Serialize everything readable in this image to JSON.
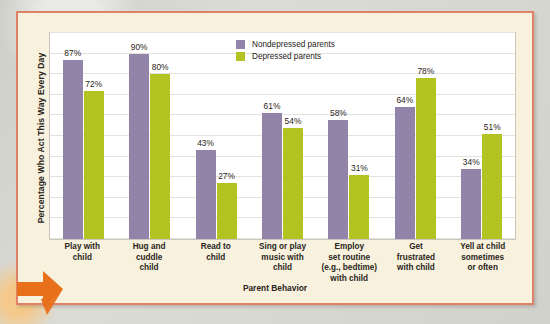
{
  "chart_data": {
    "type": "bar",
    "title": "",
    "xlabel": "Parent Behavior",
    "ylabel": "Percentage Who Act This Way Every Day",
    "ylim": [
      0,
      100
    ],
    "grid": true,
    "legend_position": "top-center",
    "value_suffix": "%",
    "categories": [
      "Play with\nchild",
      "Hug and\ncuddle\nchild",
      "Read to\nchild",
      "Sing or play\nmusic with\nchild",
      "Employ\nset routine\n(e.g., bedtime)\nwith child",
      "Get\nfrustrated\nwith child",
      "Yell at child\nsometimes\nor often"
    ],
    "series": [
      {
        "name": "Nondepressed parents",
        "color": "#9184a8",
        "values": [
          87,
          90,
          43,
          61,
          58,
          64,
          34
        ],
        "labels": [
          "87%",
          "90%",
          "43%",
          "61%",
          "58%",
          "64%",
          "34%"
        ]
      },
      {
        "name": "Depressed parents",
        "color": "#b2c322",
        "values": [
          72,
          80,
          27,
          54,
          31,
          78,
          51
        ],
        "labels": [
          "72%",
          "80%",
          "27%",
          "54%",
          "31%",
          "78%",
          "51%"
        ]
      }
    ]
  },
  "theme": {
    "panel_background": "#f7f1dd",
    "panel_border": "#e0826a",
    "plot_background": "#ffffff",
    "gridline_color": "#e3e2dc",
    "text_color": "#2a2520",
    "arrow_color": "#e8701a"
  }
}
